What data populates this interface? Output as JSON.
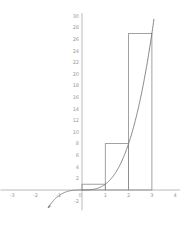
{
  "chart_data": {
    "type": "line",
    "title": "",
    "xlabel": "",
    "ylabel": "",
    "function": "y = x^3",
    "xlim": [
      -3.5,
      4.2
    ],
    "ylim": [
      -3.5,
      30.5
    ],
    "grid": false,
    "x_ticks": [
      -3,
      -2,
      -1,
      0,
      1,
      2,
      3,
      4
    ],
    "y_ticks": [
      -2,
      2,
      4,
      6,
      8,
      10,
      12,
      14,
      16,
      18,
      20,
      22,
      24,
      26,
      28,
      30
    ],
    "x_tick_labels": [
      "-3",
      "-2",
      "-1",
      "0",
      "1",
      "2",
      "3",
      "4"
    ],
    "y_tick_labels": [
      "-2",
      "2",
      "4",
      "6",
      "8",
      "10",
      "12",
      "14",
      "16",
      "18",
      "20",
      "22",
      "24",
      "26",
      "28",
      "30"
    ],
    "series": [
      {
        "name": "y = x^3",
        "type": "line",
        "x": [
          -1.45,
          -1.25,
          -1.0,
          -0.75,
          -0.5,
          -0.25,
          0,
          0.5,
          1.0,
          1.5,
          2.0,
          2.5,
          3.0,
          3.1
        ],
        "values": [
          -3.05,
          -1.95,
          -1.0,
          -0.42,
          -0.125,
          -0.016,
          0,
          0.125,
          1,
          3.375,
          8,
          15.625,
          27,
          29.79
        ]
      },
      {
        "name": "Riemann rectangles (right endpoint)",
        "type": "bar",
        "categories": [
          "[0,1]",
          "[1,2]",
          "[2,3]"
        ],
        "x_left": [
          0,
          1,
          2
        ],
        "x_right": [
          1,
          2,
          3
        ],
        "values": [
          1,
          8,
          27
        ]
      }
    ]
  }
}
